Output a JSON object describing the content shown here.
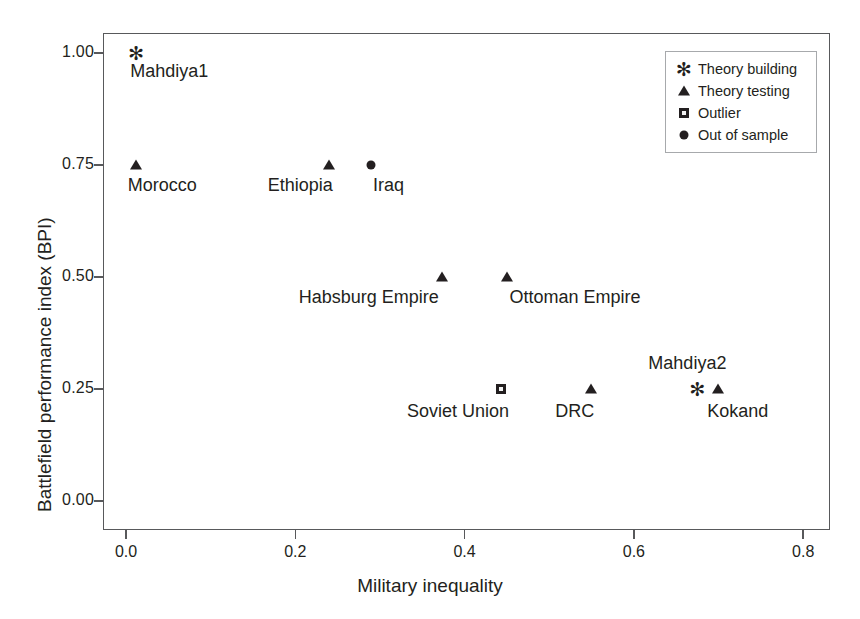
{
  "chart_data": {
    "type": "scatter",
    "title": "",
    "xlabel": "Military inequality",
    "ylabel": "Battlefield performance index (BPI)",
    "xlim": [
      -0.05,
      0.85
    ],
    "ylim": [
      -0.05,
      1.06
    ],
    "xticks": [
      "0.0",
      "0.2",
      "0.4",
      "0.6",
      "0.8"
    ],
    "xtick_values": [
      0.0,
      0.2,
      0.4,
      0.6,
      0.8
    ],
    "yticks": [
      "0.00",
      "0.25",
      "0.50",
      "0.75",
      "1.00"
    ],
    "ytick_values": [
      0.0,
      0.25,
      0.5,
      0.75,
      1.0
    ],
    "grid": false,
    "legend_position": "top-right",
    "legend": [
      {
        "marker": "asterisk-icon",
        "label": "Theory building"
      },
      {
        "marker": "triangle-icon",
        "label": "Theory testing"
      },
      {
        "marker": "square-icon",
        "label": "Outlier"
      },
      {
        "marker": "circle-icon",
        "label": "Out of sample"
      }
    ],
    "points": [
      {
        "label": "Mahdiya1",
        "x": 0.012,
        "y": 1.0,
        "group": "Theory building",
        "marker": "asterisk-icon",
        "label_dx": 33,
        "label_dy": 8
      },
      {
        "label": "Morocco",
        "x": 0.012,
        "y": 0.75,
        "group": "Theory testing",
        "marker": "triangle-icon",
        "label_dx": 26,
        "label_dy": 10
      },
      {
        "label": "Ethiopia",
        "x": 0.24,
        "y": 0.75,
        "group": "Theory testing",
        "marker": "triangle-icon",
        "label_dx": -29,
        "label_dy": 10
      },
      {
        "label": "Iraq",
        "x": 0.29,
        "y": 0.75,
        "group": "Out of sample",
        "marker": "circle-icon",
        "label_dx": 17,
        "label_dy": 10
      },
      {
        "label": "Habsburg Empire",
        "x": 0.373,
        "y": 0.5,
        "group": "Theory testing",
        "marker": "triangle-icon",
        "label_dx": -73,
        "label_dy": 10
      },
      {
        "label": "Ottoman Empire",
        "x": 0.45,
        "y": 0.5,
        "group": "Theory testing",
        "marker": "triangle-icon",
        "label_dx": 68,
        "label_dy": 10
      },
      {
        "label": "Soviet Union",
        "x": 0.443,
        "y": 0.25,
        "group": "Outlier",
        "marker": "square-icon",
        "label_dx": -43,
        "label_dy": 12
      },
      {
        "label": "DRC",
        "x": 0.549,
        "y": 0.25,
        "group": "Theory testing",
        "marker": "triangle-icon",
        "label_dx": -16,
        "label_dy": 12
      },
      {
        "label": "Mahdiya2",
        "x": 0.675,
        "y": 0.25,
        "group": "Theory building",
        "marker": "asterisk-icon",
        "label_dx": -10,
        "label_dy": -36
      },
      {
        "label": "Kokand",
        "x": 0.699,
        "y": 0.25,
        "group": "Theory testing",
        "marker": "triangle-icon",
        "label_dx": 20,
        "label_dy": 12
      }
    ]
  },
  "glyphs": {
    "asterisk": "✻"
  }
}
